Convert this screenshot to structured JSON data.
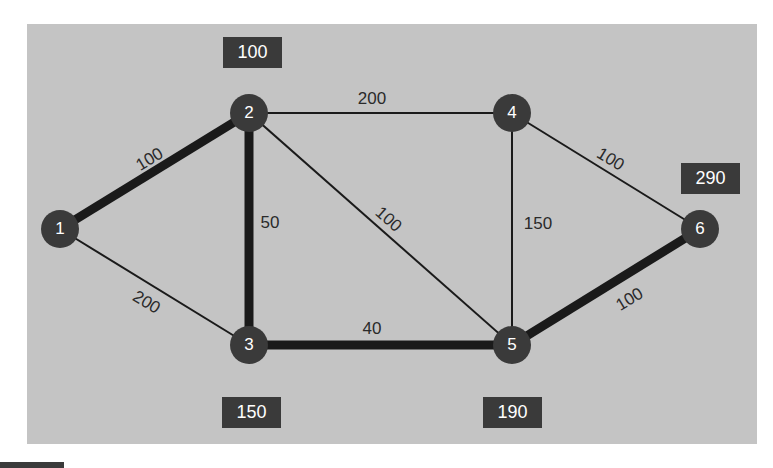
{
  "colors": {
    "background": "#c4c4c4",
    "node_fill": "#3a3a3a",
    "node_text": "#ffffff",
    "edge": "#1a1a1a",
    "label_box": "#3a3a3a",
    "label_text": "#ffffff",
    "edge_label_text": "#2a2a2a"
  },
  "graph": {
    "nodes": [
      {
        "id": "1",
        "label": "1",
        "x": 60,
        "y": 229
      },
      {
        "id": "2",
        "label": "2",
        "x": 249,
        "y": 113
      },
      {
        "id": "3",
        "label": "3",
        "x": 249,
        "y": 345
      },
      {
        "id": "4",
        "label": "4",
        "x": 512,
        "y": 113
      },
      {
        "id": "5",
        "label": "5",
        "x": 512,
        "y": 345
      },
      {
        "id": "6",
        "label": "6",
        "x": 700,
        "y": 229
      }
    ],
    "edges": [
      {
        "from": "1",
        "to": "2",
        "weight": "100",
        "highlighted": true,
        "label_x": 150,
        "label_y": 160,
        "rotate": -31
      },
      {
        "from": "1",
        "to": "3",
        "weight": "200",
        "highlighted": false,
        "label_x": 146,
        "label_y": 303,
        "rotate": 31
      },
      {
        "from": "2",
        "to": "3",
        "weight": "50",
        "highlighted": true,
        "label_x": 270,
        "label_y": 224,
        "rotate": 0
      },
      {
        "from": "2",
        "to": "4",
        "weight": "200",
        "highlighted": false,
        "label_x": 372,
        "label_y": 100,
        "rotate": 0
      },
      {
        "from": "2",
        "to": "5",
        "weight": "100",
        "highlighted": false,
        "label_x": 388,
        "label_y": 220,
        "rotate": 41
      },
      {
        "from": "3",
        "to": "5",
        "weight": "40",
        "highlighted": true,
        "label_x": 372,
        "label_y": 330,
        "rotate": 0
      },
      {
        "from": "4",
        "to": "5",
        "weight": "150",
        "highlighted": false,
        "label_x": 538,
        "label_y": 225,
        "rotate": 0
      },
      {
        "from": "4",
        "to": "6",
        "weight": "100",
        "highlighted": false,
        "label_x": 610,
        "label_y": 160,
        "rotate": 31
      },
      {
        "from": "5",
        "to": "6",
        "weight": "100",
        "highlighted": true,
        "label_x": 630,
        "label_y": 300,
        "rotate": -31
      }
    ],
    "distance_labels": [
      {
        "node": "2",
        "value": "100",
        "x": 223,
        "y": 37
      },
      {
        "node": "3",
        "value": "150",
        "x": 222,
        "y": 397
      },
      {
        "node": "5",
        "value": "190",
        "x": 483,
        "y": 397
      },
      {
        "node": "6",
        "value": "290",
        "x": 681,
        "y": 163
      }
    ]
  }
}
